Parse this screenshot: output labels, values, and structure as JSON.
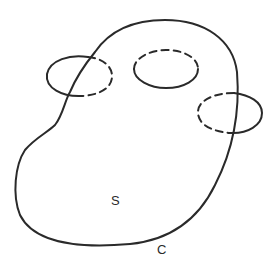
{
  "diagram": {
    "surface_label": "S",
    "boundary_label": "C",
    "colors": {
      "stroke": "#2a2a2a",
      "background": "#ffffff"
    },
    "elements": [
      {
        "name": "surface-boundary-curve",
        "type": "closed-curve",
        "label": "C"
      },
      {
        "name": "left-handle-loop",
        "type": "ellipse",
        "style": "solid outside, dashed inside"
      },
      {
        "name": "middle-hole-loop",
        "type": "ellipse",
        "style": "dashed top, solid bottom"
      },
      {
        "name": "right-handle-loop",
        "type": "ellipse",
        "style": "dashed inside, solid outside"
      }
    ]
  }
}
